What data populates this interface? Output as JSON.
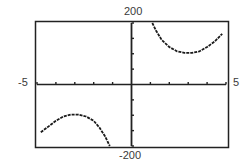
{
  "chart_data": {
    "type": "line",
    "title": "",
    "xlabel": "",
    "ylabel": "",
    "xlim": [
      -5,
      5
    ],
    "ylim": [
      -200,
      200
    ],
    "grid": false,
    "x_tick_step": 1,
    "y_tick_step": 50,
    "window_labels": {
      "xmin": "-5",
      "xmax": "5",
      "ymin": "-200",
      "ymax": "200"
    },
    "series": [
      {
        "name": "right-branch",
        "points": [
          [
            1.1,
            200
          ],
          [
            1.3,
            175
          ],
          [
            1.6,
            145
          ],
          [
            2.0,
            122
          ],
          [
            2.4,
            108
          ],
          [
            2.8,
            103
          ],
          [
            3.2,
            103
          ],
          [
            3.6,
            108
          ],
          [
            4.0,
            122
          ],
          [
            4.4,
            140
          ],
          [
            4.8,
            165
          ]
        ]
      },
      {
        "name": "left-branch",
        "points": [
          [
            -4.8,
            -155
          ],
          [
            -4.4,
            -137
          ],
          [
            -4.0,
            -118
          ],
          [
            -3.6,
            -104
          ],
          [
            -3.2,
            -98
          ],
          [
            -2.8,
            -98
          ],
          [
            -2.4,
            -104
          ],
          [
            -2.0,
            -118
          ],
          [
            -1.7,
            -140
          ],
          [
            -1.4,
            -168
          ],
          [
            -1.15,
            -200
          ]
        ]
      }
    ]
  }
}
